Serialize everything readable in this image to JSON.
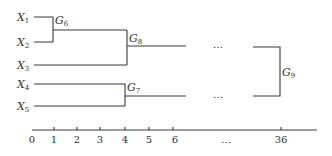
{
  "diagram": {
    "type": "dendrogram",
    "leaves": [
      {
        "name": "X",
        "sub": "1",
        "y": 17
      },
      {
        "name": "X",
        "sub": "2",
        "y": 42
      },
      {
        "name": "X",
        "sub": "3",
        "y": 65
      },
      {
        "name": "X",
        "sub": "4",
        "y": 84
      },
      {
        "name": "X",
        "sub": "5",
        "y": 106
      }
    ],
    "nodes": [
      {
        "name": "G",
        "sub": "6",
        "merges": [
          "X1",
          "X2"
        ],
        "height": 1
      },
      {
        "name": "G",
        "sub": "7",
        "merges": [
          "X4",
          "X5"
        ],
        "height": 4
      },
      {
        "name": "G",
        "sub": "8",
        "merges": [
          "G6",
          "X3"
        ],
        "height": 4
      },
      {
        "name": "G",
        "sub": "9",
        "merges": [
          "G8",
          "G7"
        ],
        "height": 36
      }
    ],
    "ellipsis": "…",
    "axis": {
      "ticks": [
        "0",
        "1",
        "2",
        "3",
        "4",
        "5",
        "6"
      ],
      "tick_x": [
        32,
        54,
        77,
        100,
        125,
        149,
        173
      ],
      "ellipsis": "…",
      "end_tick": "36"
    },
    "colors": {
      "line": "#3a3a3a",
      "text": "#333333",
      "background": "#ffffff"
    }
  }
}
